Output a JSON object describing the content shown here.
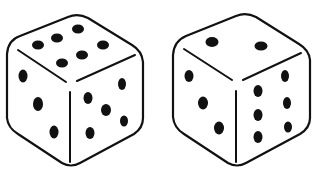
{
  "image": {
    "subject": "Two white six-sided dice, black line drawing",
    "background_color": "#ffffff",
    "ink_color": "#111111"
  },
  "dice": [
    {
      "label": "left die",
      "top_face": 6,
      "left_face": 3,
      "right_face": 5
    },
    {
      "label": "right die",
      "top_face": 2,
      "left_face": 3,
      "right_face": 6
    }
  ]
}
